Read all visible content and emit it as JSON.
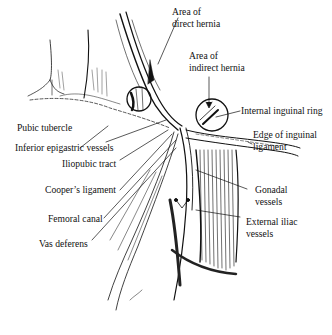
{
  "figure": {
    "colors": {
      "ink": "#111111",
      "background": "#ffffff"
    }
  },
  "labels": {
    "direct_hernia": [
      "Area of",
      "direct hernia"
    ],
    "indirect_hernia": [
      "Area of",
      "indirect hernia"
    ],
    "internal_ring": "Internal inguinal ring",
    "pubic_tubercle": "Pubic tubercle",
    "inferior_epigastric": "Inferior epigastric vessels",
    "edge_inguinal": [
      "Edge of inguinal",
      "ligament"
    ],
    "iliopubic": "Iliopubic tract",
    "coopers": "Cooper’s ligament",
    "gonadal": [
      "Gonadal",
      "vessels"
    ],
    "femoral": "Femoral canal",
    "external_iliac": [
      "External iliac",
      "vessels"
    ],
    "vas": "Vas deferens"
  }
}
